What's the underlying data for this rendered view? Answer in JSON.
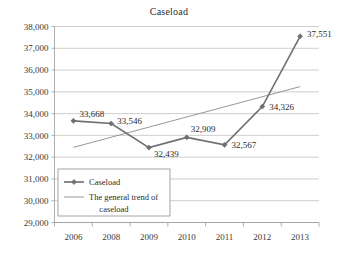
{
  "chart_data": {
    "type": "line",
    "title": "Caseload",
    "xlabel": "",
    "ylabel": "",
    "categories": [
      "2006",
      "2008",
      "2009",
      "2010",
      "2011",
      "2012",
      "2013"
    ],
    "series": [
      {
        "name": "Caseload",
        "values": [
          33668,
          33546,
          32439,
          32909,
          32567,
          34326,
          37551
        ],
        "labels": [
          "33,668",
          "33,546",
          "32,439",
          "32,909",
          "32,567",
          "34,326",
          "37,551"
        ],
        "marker": "diamond",
        "color": "#6f6f6f"
      },
      {
        "name": "The general trend of caseload",
        "type": "trend",
        "values": [
          32450,
          33070,
          33380,
          33690,
          34000,
          34620,
          35240
        ],
        "color": "#8a8a8a"
      }
    ],
    "ylim": [
      29000,
      38000
    ],
    "yticks": [
      29000,
      30000,
      31000,
      32000,
      33000,
      34000,
      35000,
      36000,
      37000,
      38000
    ],
    "ytick_labels": [
      "29,000",
      "30,000",
      "31,000",
      "32,000",
      "33,000",
      "34,000",
      "35,000",
      "36,000",
      "37,000",
      "38,000"
    ],
    "grid": true,
    "legend_position": "inside-lower-left",
    "legend_entries": [
      {
        "label": "Caseload",
        "style": "line-with-marker"
      },
      {
        "label": "The general trend of",
        "label2": "caseload",
        "style": "line"
      }
    ]
  }
}
